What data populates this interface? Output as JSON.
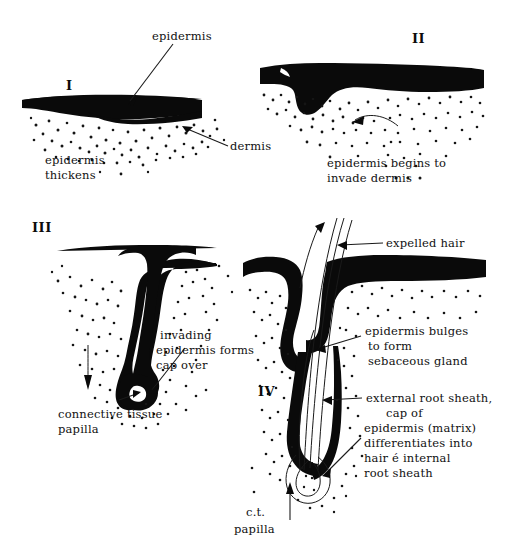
{
  "figure": {
    "background_color": "#ffffff",
    "ink_color": "#0a0a0a"
  },
  "stages": [
    {
      "numeral": "I",
      "caption_line1": "epidermis",
      "caption_line2": "thickens",
      "labels": [
        "epidermis",
        "dermis"
      ]
    },
    {
      "numeral": "II",
      "caption_line1": "epidermis begins to",
      "caption_line2": "invade dermis",
      "labels": []
    },
    {
      "numeral": "III",
      "caption_line1": "",
      "caption_line2": "",
      "labels": [
        "invading",
        "epidermis forms",
        "cap over",
        "connective  tissue",
        "papilla"
      ]
    },
    {
      "numeral": "IV",
      "caption_line1": "",
      "caption_line2": "",
      "labels": [
        "expelled hair",
        "epidermis bulges",
        "to form",
        "sebaceous gland",
        "external root sheath,",
        "cap  of",
        "epidermis (matrix)",
        "differentiates into",
        "hair é internal",
        "root sheath",
        "c.t.",
        "papilla"
      ]
    }
  ],
  "annotations": {
    "epidermis_top": "epidermis",
    "dermis": "dermis",
    "stage1_cap1": "epidermis",
    "stage1_cap2": "thickens",
    "stage2_cap1": "epidermis begins to",
    "stage2_cap2": "invade dermis",
    "stage3_inv1": "invading",
    "stage3_inv2": "epidermis forms",
    "stage3_inv3": "cap over",
    "stage3_ct1": "connective  tissue",
    "stage3_ct2": "papilla",
    "stage4_expelled": "expelled hair",
    "stage4_seb1": "epidermis bulges",
    "stage4_seb2": "to form",
    "stage4_seb3": "sebaceous gland",
    "stage4_ers1": "external root sheath,",
    "stage4_ers2": "cap  of",
    "stage4_ers3": "epidermis (matrix)",
    "stage4_ers4": "differentiates into",
    "stage4_ers5": "hair é internal",
    "stage4_ers6": "root sheath",
    "stage4_ct1": "c.t.",
    "stage4_ct2": "papilla",
    "numeral_1": "I",
    "numeral_2": "II",
    "numeral_3": "III",
    "numeral_4": "IV"
  }
}
